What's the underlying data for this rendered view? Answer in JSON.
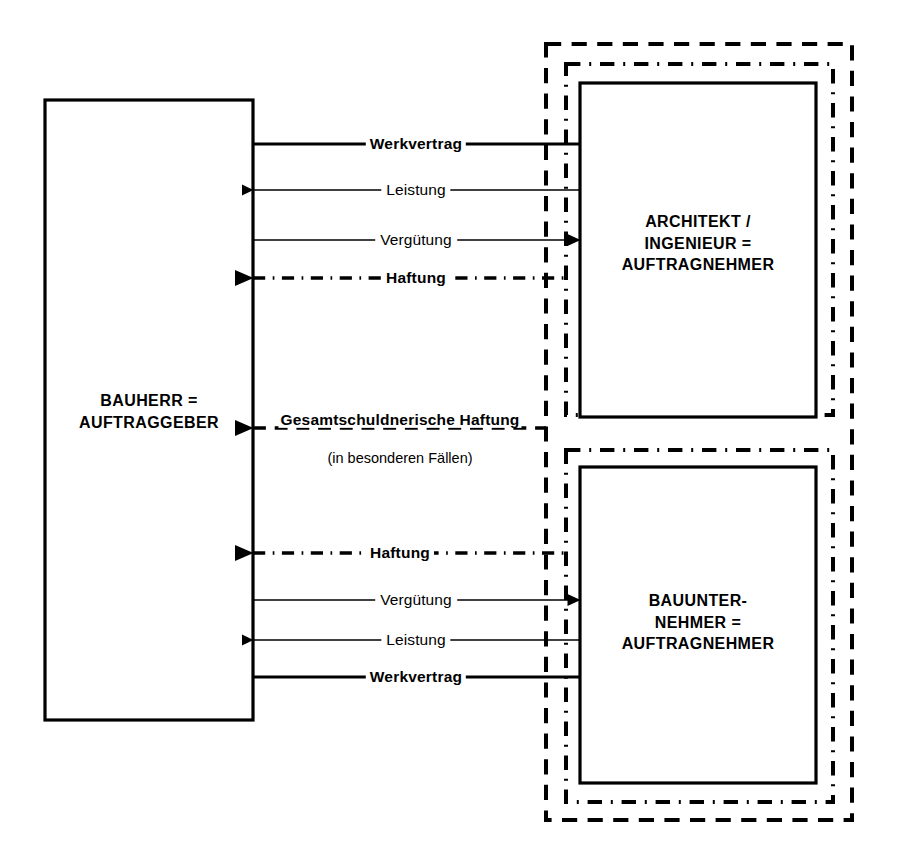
{
  "diagram": {
    "language": "de",
    "background": "#ffffff",
    "stroke": "#000000",
    "boxes": [
      {
        "id": "bauherr",
        "name": "client-box",
        "lines": [
          "BAUHERR =",
          "AUFTRAGGEBER"
        ],
        "x": 45,
        "y": 100,
        "w": 208,
        "h": 620,
        "style": "solid"
      },
      {
        "id": "architekt",
        "name": "architect-box",
        "lines": [
          "ARCHITEKT /",
          "INGENIEUR =",
          "AUFTRAGNEHMER"
        ],
        "x": 580,
        "y": 83,
        "w": 236,
        "h": 334,
        "style": "solid"
      },
      {
        "id": "bauunternehmer",
        "name": "contractor-box",
        "lines": [
          "BAUUNTER-",
          "NEHMER =",
          "AUFTRAGNEHMER"
        ],
        "x": 580,
        "y": 467,
        "w": 236,
        "h": 316,
        "style": "solid"
      }
    ],
    "enclosures": [
      {
        "id": "outer-dashed",
        "name": "outer-dashed-enclosure",
        "x": 546,
        "y": 44,
        "w": 306,
        "h": 776,
        "style": "dashed"
      },
      {
        "id": "dashdot-top",
        "name": "architect-dashdot-enclosure",
        "x": 566,
        "y": 64,
        "w": 267,
        "h": 351,
        "style": "dashdot"
      },
      {
        "id": "dashdot-bottom",
        "name": "contractor-dashdot-enclosure",
        "x": 566,
        "y": 450,
        "w": 267,
        "h": 352,
        "style": "dashdot"
      }
    ],
    "flows": [
      {
        "id": "f1",
        "name": "flow-werkvertrag-architekt",
        "label": "Werkvertrag",
        "bold": true,
        "y": 144,
        "x1": 253,
        "x2": 580,
        "direction": "none",
        "style": "solid",
        "weight": 3
      },
      {
        "id": "f2",
        "name": "flow-leistung-architekt",
        "label": "Leistung",
        "bold": false,
        "y": 190,
        "x1": 253,
        "x2": 580,
        "direction": "left",
        "style": "solid",
        "weight": 1.6
      },
      {
        "id": "f3",
        "name": "flow-verguetung-architekt",
        "label": "Vergütung",
        "bold": false,
        "y": 240,
        "x1": 253,
        "x2": 580,
        "direction": "right",
        "style": "solid",
        "weight": 1.6
      },
      {
        "id": "f4",
        "name": "flow-haftung-architekt",
        "label": "Haftung",
        "bold": true,
        "y": 278,
        "x1": 253,
        "x2": 566,
        "direction": "left",
        "style": "dashdot",
        "weight": 3.4
      },
      {
        "id": "f5",
        "name": "flow-gesamtschuldnerische-haftung",
        "label": "Gesamtschuldnerische Haftung",
        "sublabel": "(in besonderen Fällen)",
        "bold": true,
        "y": 428,
        "x1": 253,
        "x2": 546,
        "direction": "left",
        "style": "dashed",
        "weight": 3.4
      },
      {
        "id": "f6",
        "name": "flow-haftung-bauunternehmer",
        "label": "Haftung",
        "bold": true,
        "y": 553,
        "x1": 253,
        "x2": 566,
        "direction": "left",
        "style": "dashdot",
        "weight": 3.4
      },
      {
        "id": "f7",
        "name": "flow-verguetung-bauunternehmer",
        "label": "Vergütung",
        "bold": false,
        "y": 600,
        "x1": 253,
        "x2": 580,
        "direction": "right",
        "style": "solid",
        "weight": 1.6
      },
      {
        "id": "f8",
        "name": "flow-leistung-bauunternehmer",
        "label": "Leistung",
        "bold": false,
        "y": 640,
        "x1": 253,
        "x2": 580,
        "direction": "left",
        "style": "solid",
        "weight": 1.6
      },
      {
        "id": "f9",
        "name": "flow-werkvertrag-bauunternehmer",
        "label": "Werkvertrag",
        "bold": true,
        "y": 677,
        "x1": 253,
        "x2": 580,
        "direction": "none",
        "style": "solid",
        "weight": 3
      }
    ]
  }
}
